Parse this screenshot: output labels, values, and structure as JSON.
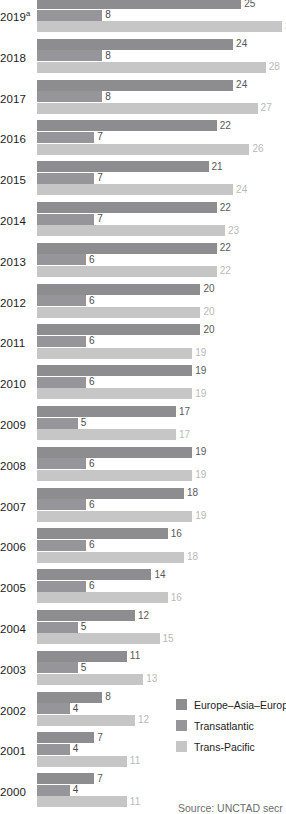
{
  "chart_data": {
    "type": "bar",
    "orientation": "horizontal",
    "title": "",
    "subtitle": "",
    "xlabel": "",
    "ylabel": "",
    "grid": false,
    "xlim": [
      0,
      30
    ],
    "legend_position": "bottom-right",
    "categories": [
      "2019a",
      "2018",
      "2017",
      "2016",
      "2015",
      "2014",
      "2013",
      "2012",
      "2011",
      "2010",
      "2009",
      "2008",
      "2007",
      "2006",
      "2005",
      "2004",
      "2003",
      "2002",
      "2001",
      "2000",
      "1999",
      "1998",
      "1997",
      "1996"
    ],
    "tick_labels": [
      "2019ᵃ",
      "2018",
      "2017",
      "2016",
      "2015",
      "2014",
      "2013",
      "2012",
      "2011",
      "2010",
      "2009",
      "2008",
      "2007",
      "2006",
      "2005",
      "2004",
      "2003",
      "2002",
      "2001",
      "2000",
      "1999",
      "1998",
      "1997",
      "1996"
    ],
    "series": [
      {
        "name": "Europe–Asia–Europe",
        "color": "#8d8d8f",
        "values": [
          25,
          24,
          24,
          22,
          21,
          22,
          22,
          20,
          20,
          19,
          17,
          19,
          18,
          16,
          14,
          12,
          11,
          8,
          7,
          7,
          6,
          6,
          5,
          5
        ]
      },
      {
        "name": "Transatlantic",
        "color": "#95959a",
        "values": [
          8,
          8,
          8,
          7,
          7,
          7,
          6,
          6,
          6,
          6,
          5,
          6,
          6,
          6,
          6,
          5,
          5,
          4,
          4,
          4,
          4,
          4,
          4,
          3
        ]
      },
      {
        "name": "Trans-Pacific",
        "color": "#c6c6c6",
        "values": [
          30,
          28,
          27,
          26,
          24,
          23,
          22,
          20,
          19,
          19,
          17,
          19,
          19,
          18,
          16,
          15,
          13,
          12,
          11,
          11,
          9,
          9,
          8,
          8
        ]
      }
    ]
  },
  "legend": {
    "items": [
      {
        "label": "Europe–Asia–Europe",
        "color": "#8d8d8f"
      },
      {
        "label": "Transatlantic",
        "color": "#95959a"
      },
      {
        "label": "Trans-Pacific",
        "color": "#c6c6c6"
      }
    ]
  },
  "footer": {
    "source": "Source: UNCTAD secr"
  }
}
